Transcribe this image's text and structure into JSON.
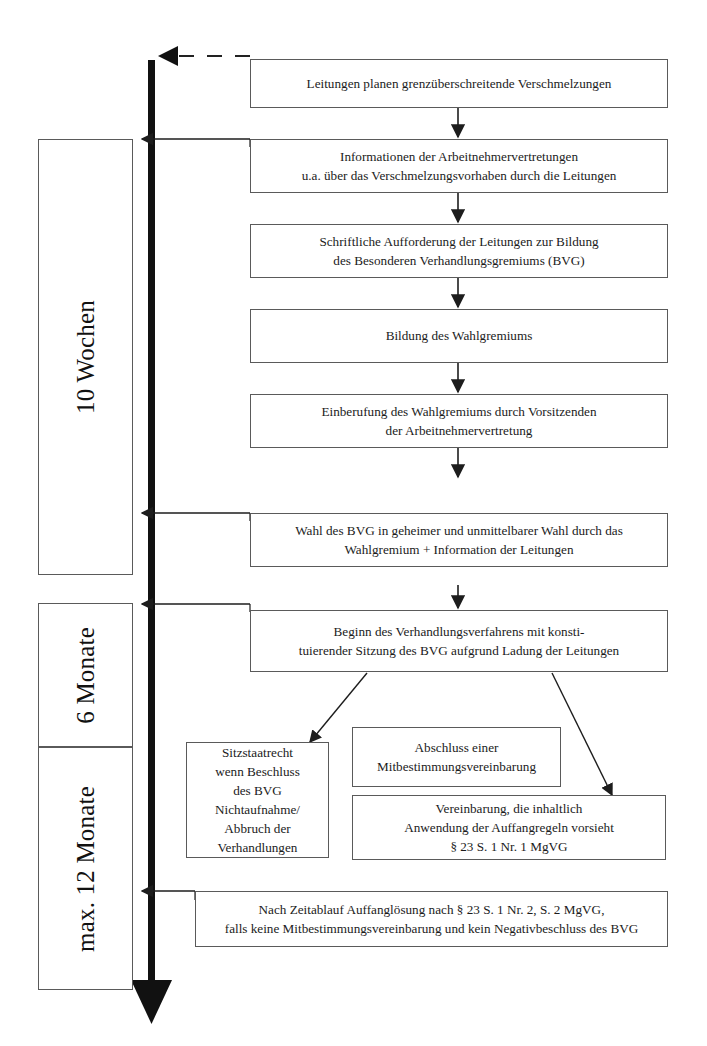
{
  "diagram": {
    "colors": {
      "box_border": "#5a5a5a",
      "line": "#2a2a2a",
      "spine": "#111111",
      "background": "#ffffff",
      "text": "#1b1b1b"
    }
  },
  "timeline": {
    "phases": [
      {
        "id": "phase-10-wochen",
        "label": "10 Wochen"
      },
      {
        "id": "phase-6-monate",
        "label": "6 Monate"
      },
      {
        "id": "phase-max-12-monate",
        "label": "max. 12 Monate"
      }
    ]
  },
  "steps": [
    {
      "id": "step-leitungen-planen",
      "text": "Leitungen planen grenzüberschreitende Verschmelzungen"
    },
    {
      "id": "step-informationen",
      "text": "Informationen der Arbeitnehmervertretungen\nu.a. über das Verschmelzungsvorhaben durch die Leitungen"
    },
    {
      "id": "step-schriftliche-aufforderung",
      "text": "Schriftliche Aufforderung der Leitungen zur Bildung\ndes Besonderen Verhandlungsgremiums (BVG)"
    },
    {
      "id": "step-bildung-wahlgremium",
      "text": "Bildung des Wahlgremiums"
    },
    {
      "id": "step-einberufung-wahlgremium",
      "text": "Einberufung des Wahlgremiums durch Vorsitzenden\nder Arbeitnehmervertretung"
    },
    {
      "id": "step-wahl-bvg",
      "text": "Wahl des BVG in geheimer und unmittelbarer Wahl durch das\nWahlgremium + Information der Leitungen"
    },
    {
      "id": "step-beginn-verhandlungsverfahren",
      "text": "Beginn des Verhandlungsverfahrens mit konsti-\ntuierender Sitzung des BVG aufgrund Ladung der Leitungen"
    }
  ],
  "outcomes": [
    {
      "id": "outcome-sitzstaatrecht",
      "text": "Sitzstaatrecht\nwenn Beschluss\ndes BVG\nNichtaufnahme/\nAbbruch der\nVerhandlungen"
    },
    {
      "id": "outcome-abschluss-vereinbarung",
      "text": "Abschluss einer\nMitbestimmungsvereinbarung"
    },
    {
      "id": "outcome-auffangregeln",
      "text": "Vereinbarung, die inhaltlich\nAnwendung der Auffangregeln vorsieht\n§ 23 S. 1 Nr. 1 MgVG"
    }
  ],
  "final_step": {
    "id": "step-auffangloesung",
    "text": "Nach Zeitablauf Auffanglösung nach § 23 S. 1 Nr. 2, S. 2 MgVG,\nfalls keine Mitbestimmungsvereinbarung und kein Negativbeschluss des BVG"
  }
}
